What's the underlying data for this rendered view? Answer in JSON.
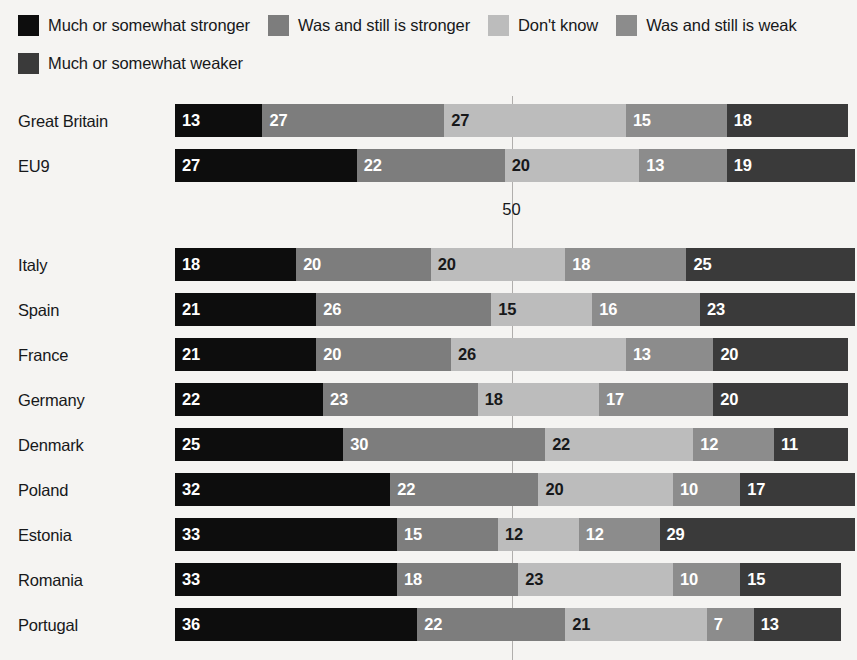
{
  "legend": {
    "rows": [
      [
        {
          "label": "Much or somewhat stronger",
          "color": "#0d0d0d",
          "key": "much-or-somewhat-stronger"
        },
        {
          "label": "Was and still is stronger",
          "color": "#7d7d7d",
          "key": "was-and-still-is-stronger"
        },
        {
          "label": "Don't know",
          "color": "#bcbcbc",
          "key": "dont-know"
        },
        {
          "label": "Was and still is weak",
          "color": "#8c8c8c",
          "key": "was-and-still-is-weak"
        }
      ],
      [
        {
          "label": "Much or somewhat weaker",
          "color": "#3a3a3a",
          "key": "much-or-somewhat-weaker"
        }
      ]
    ]
  },
  "axis": {
    "midline_label": "50",
    "midline_value": 50
  },
  "chart_data": {
    "type": "bar",
    "orientation": "horizontal",
    "stacked": true,
    "title": "",
    "xlabel": "",
    "ylabel": "",
    "xlim": [
      0,
      100
    ],
    "grid": true,
    "gridlines": [
      50
    ],
    "legend_position": "top",
    "categories": [
      "Great Britain",
      "EU9",
      "Italy",
      "Spain",
      "France",
      "Germany",
      "Denmark",
      "Poland",
      "Estonia",
      "Romania",
      "Portugal"
    ],
    "series": [
      {
        "name": "Much or somewhat stronger",
        "color": "#0d0d0d",
        "text_color": "#ffffff",
        "values": [
          13,
          27,
          18,
          21,
          21,
          22,
          25,
          32,
          33,
          33,
          36
        ]
      },
      {
        "name": "Was and still is stronger",
        "color": "#7d7d7d",
        "text_color": "#ffffff",
        "values": [
          27,
          22,
          20,
          26,
          20,
          23,
          30,
          22,
          15,
          18,
          22
        ]
      },
      {
        "name": "Don't know",
        "color": "#bcbcbc",
        "text_color": "#17181a",
        "values": [
          27,
          20,
          20,
          15,
          26,
          18,
          22,
          20,
          12,
          23,
          21
        ]
      },
      {
        "name": "Was and still is weak",
        "color": "#8c8c8c",
        "text_color": "#ffffff",
        "values": [
          15,
          13,
          18,
          16,
          13,
          17,
          12,
          10,
          12,
          10,
          7
        ]
      },
      {
        "name": "Much or somewhat weaker",
        "color": "#3a3a3a",
        "text_color": "#ffffff",
        "values": [
          18,
          19,
          25,
          23,
          20,
          20,
          11,
          17,
          29,
          15,
          13
        ]
      }
    ]
  },
  "layout": {
    "plot_left_px": 175,
    "plot_width_px": 673,
    "row_tops_px": [
      8,
      53,
      152,
      197,
      242,
      287,
      332,
      377,
      422,
      467,
      512
    ],
    "midlabel_top_px": 104
  }
}
